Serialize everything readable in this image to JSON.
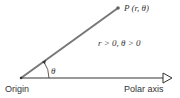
{
  "diagram": {
    "point_label": "P (r, θ)",
    "condition_label": "r > 0, θ > 0",
    "angle_label": "θ",
    "origin_label": "Origin",
    "axis_label": "Polar axis",
    "colors": {
      "ray": "#777777",
      "axis": "#333333",
      "text": "#333333"
    }
  }
}
